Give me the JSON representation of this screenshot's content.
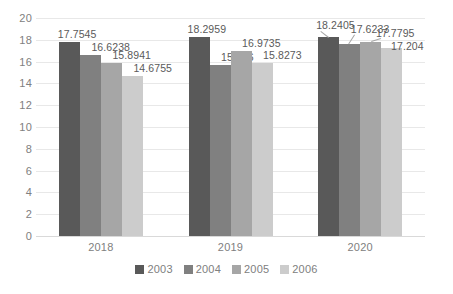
{
  "chart_data": {
    "type": "bar",
    "title": "",
    "subtitle": "",
    "xlabel": "",
    "ylabel": "",
    "categories": [
      "2018",
      "2019",
      "2020"
    ],
    "series": [
      {
        "name": "2003",
        "color": "#595959",
        "values": [
          17.7545,
          18.2959,
          18.2405
        ]
      },
      {
        "name": "2004",
        "color": "#808080",
        "values": [
          16.6238,
          15.676,
          17.6233
        ]
      },
      {
        "name": "2005",
        "color": "#a6a6a6",
        "values": [
          15.8941,
          16.9735,
          17.7795
        ]
      },
      {
        "name": "2006",
        "color": "#cccccc",
        "values": [
          14.6755,
          15.8273,
          17.204
        ]
      }
    ],
    "data_labels": [
      [
        "17.7545",
        "16.6238",
        "15.8941",
        "14.6755"
      ],
      [
        "18.2959",
        "15.676",
        "16.9735",
        "15.8273"
      ],
      [
        "18.2405",
        "17.6233",
        "17.7795",
        "17.204"
      ]
    ],
    "ylim": [
      0,
      20
    ],
    "ytick_step": 2,
    "yticks": [
      "20",
      "18",
      "16",
      "14",
      "12",
      "10",
      "8",
      "6",
      "4",
      "2",
      "0"
    ],
    "grid": true,
    "grid_color": "#e8e8e8",
    "legend_position": "bottom",
    "background_color": "#ffffff",
    "axis_text_color": "#808080",
    "label_text_color": "#5a5a5a"
  },
  "legend": {
    "items": [
      {
        "label": "2003",
        "color": "#595959"
      },
      {
        "label": "2004",
        "color": "#808080"
      },
      {
        "label": "2005",
        "color": "#a6a6a6"
      },
      {
        "label": "2006",
        "color": "#cccccc"
      }
    ]
  }
}
